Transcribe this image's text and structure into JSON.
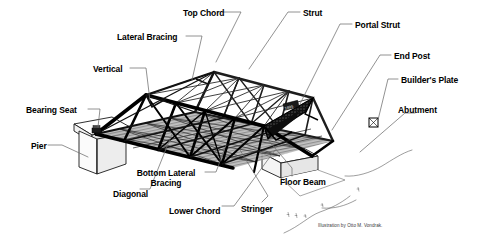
{
  "diagram": {
    "credit": "Illustration by Otto M. Vondrak.",
    "background_color": "#ffffff",
    "ink_color": "#000000",
    "deck_color": "#9a9a9a",
    "labels": [
      {
        "id": "top-chord",
        "text": "Top Chord",
        "x": 183,
        "y": 9,
        "align": "left"
      },
      {
        "id": "strut",
        "text": "Strut",
        "x": 303,
        "y": 9,
        "align": "left"
      },
      {
        "id": "portal-strut",
        "text": "Portal Strut",
        "x": 355,
        "y": 21,
        "align": "left"
      },
      {
        "id": "lateral-bracing",
        "text": "Lateral Bracing",
        "x": 117,
        "y": 33,
        "align": "left"
      },
      {
        "id": "end-post",
        "text": "End Post",
        "x": 394,
        "y": 52,
        "align": "left"
      },
      {
        "id": "vertical",
        "text": "Vertical",
        "x": 93,
        "y": 65,
        "align": "left"
      },
      {
        "id": "builders-plate",
        "text": "Builder's Plate",
        "x": 401,
        "y": 76,
        "align": "left"
      },
      {
        "id": "abutment",
        "text": "Abutment",
        "x": 398,
        "y": 106,
        "align": "left"
      },
      {
        "id": "bearing-seat",
        "text": "Bearing Seat",
        "x": 26,
        "y": 106,
        "align": "left"
      },
      {
        "id": "pier",
        "text": "Pier",
        "x": 31,
        "y": 142,
        "align": "left"
      },
      {
        "id": "bottom-lateral-bracing",
        "text": "Bottom Lateral\nBracing",
        "x": 159,
        "y": 169,
        "align": "center"
      },
      {
        "id": "floor-beam",
        "text": "Floor Beam",
        "x": 280,
        "y": 178,
        "align": "left"
      },
      {
        "id": "diagonal",
        "text": "Diagonal",
        "x": 113,
        "y": 190,
        "align": "left"
      },
      {
        "id": "lower-chord",
        "text": "Lower Chord",
        "x": 169,
        "y": 207,
        "align": "left"
      },
      {
        "id": "stringer",
        "text": "Stringer",
        "x": 241,
        "y": 205,
        "align": "left"
      }
    ]
  }
}
